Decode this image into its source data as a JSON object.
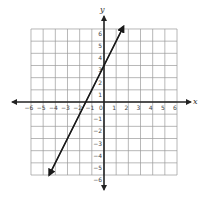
{
  "chart_data": {
    "type": "line",
    "title": "",
    "xlabel": "x",
    "ylabel": "y",
    "xlim": [
      -6,
      6
    ],
    "ylim": [
      -6,
      6
    ],
    "grid": true,
    "x_ticks": [
      -6,
      -5,
      -4,
      -3,
      -2,
      -1,
      0,
      1,
      2,
      3,
      4,
      5,
      6
    ],
    "y_ticks": [
      -6,
      -5,
      -4,
      -3,
      -2,
      -1,
      1,
      2,
      3,
      4,
      5,
      6
    ],
    "series": [
      {
        "name": "line",
        "equation": "y = 2x + 3",
        "slope": 2,
        "intercept": 3,
        "x": [
          -4.5,
          1.6
        ],
        "y": [
          -6,
          6.2
        ],
        "arrows_both_ends": true
      }
    ],
    "key_points": [
      {
        "label": "y-intercept",
        "x": 0,
        "y": 3
      },
      {
        "label": "x-intercept",
        "x": -1.5,
        "y": 0
      }
    ]
  },
  "colors": {
    "grid": "#9a9a9a",
    "axis": "#222222",
    "line": "#1a1a1a",
    "tick_text": "#444444"
  }
}
